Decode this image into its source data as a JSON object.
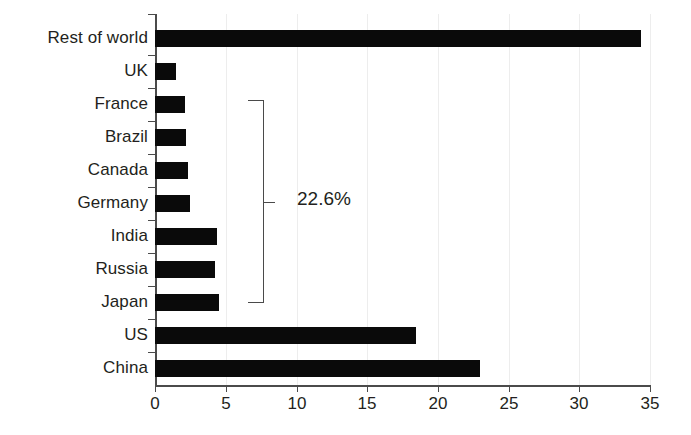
{
  "chart_data": {
    "type": "bar",
    "orientation": "horizontal",
    "title": "",
    "subtitle": "",
    "xlabel": "",
    "ylabel": "",
    "categories": [
      "Rest of world",
      "UK",
      "France",
      "Brazil",
      "Canada",
      "Germany",
      "India",
      "Russia",
      "Japan",
      "US",
      "China"
    ],
    "values": [
      34.3,
      1.5,
      2.1,
      2.2,
      2.3,
      2.5,
      4.4,
      4.2,
      4.5,
      18.4,
      22.9
    ],
    "series": [
      {
        "name": "Share",
        "values": [
          34.3,
          1.5,
          2.1,
          2.2,
          2.3,
          2.5,
          4.4,
          4.2,
          4.5,
          18.4,
          22.9
        ]
      }
    ],
    "xlim": [
      0,
      35
    ],
    "xticks": [
      0,
      5,
      10,
      15,
      20,
      25,
      30,
      35
    ],
    "xtick_labels": [
      "0",
      "5",
      "10",
      "15",
      "20",
      "25",
      "30",
      "35"
    ],
    "grid": "vertical-faint",
    "legend": "none",
    "bar_color": "#0a0a0a",
    "axis_color": "#4b4b4b",
    "gridline_color": "#ededed",
    "text_color": "#231f20",
    "annotations": [
      {
        "type": "bracket",
        "label": "22.6%",
        "spans_categories": [
          "France",
          "Brazil",
          "Canada",
          "Germany",
          "India",
          "Russia",
          "Japan"
        ]
      }
    ]
  }
}
